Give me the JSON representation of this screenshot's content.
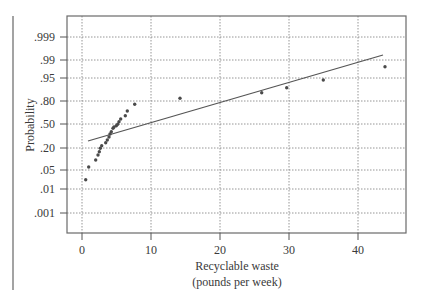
{
  "chart_data": {
    "type": "scatter",
    "subtype": "normal-probability-plot",
    "title": "",
    "xlabel": "Recyclable waste",
    "xlabel_line2": "(pounds per week)",
    "ylabel": "Probability",
    "xlim": [
      -1.9,
      45.1
    ],
    "x_ticks": [
      0,
      10,
      20,
      30,
      40
    ],
    "x_tick_labels": [
      "0",
      "10",
      "20",
      "30",
      "40"
    ],
    "y_ticks": [
      0.999,
      0.99,
      0.95,
      0.8,
      0.5,
      0.2,
      0.05,
      0.01,
      0.001
    ],
    "y_tick_labels": [
      ".999",
      ".99",
      ".95",
      ".80",
      ".50",
      ".20",
      ".05",
      ".01",
      ".001"
    ],
    "grid": true,
    "legend": null,
    "series": [
      {
        "name": "Observed data",
        "kind": "points",
        "x": [
          0.5,
          1.0,
          2.0,
          2.3,
          2.5,
          2.7,
          2.9,
          3.4,
          3.7,
          3.9,
          4.1,
          4.2,
          4.5,
          4.6,
          5.0,
          5.2,
          5.4,
          5.6,
          6.3,
          6.6,
          7.6,
          14.2,
          26.0,
          29.7,
          35.0,
          43.9
        ],
        "y": [
          0.025,
          0.07,
          0.12,
          0.15,
          0.18,
          0.2,
          0.24,
          0.28,
          0.31,
          0.35,
          0.38,
          0.41,
          0.45,
          0.46,
          0.48,
          0.5,
          0.54,
          0.57,
          0.62,
          0.68,
          0.77,
          0.83,
          0.87,
          0.89,
          0.94,
          0.97
        ]
      },
      {
        "name": "Normal reference line",
        "kind": "line",
        "x": [
          0.9,
          43.6
        ],
        "y": [
          0.31,
          0.975
        ]
      }
    ]
  },
  "layout_px": {
    "frame": {
      "left": 67,
      "top": 16,
      "right": 406,
      "bottom": 233
    },
    "x_px": {
      "0": 82,
      "10": 151,
      "20": 220,
      "30": 289,
      "40": 358
    },
    "y_px": {
      ".999": 37,
      ".99": 60,
      ".95": 78,
      ".80": 101,
      ".50": 124,
      ".20": 148,
      ".05": 170,
      ".01": 189,
      ".001": 213
    },
    "points_px": [
      [
        85.7,
        179.7
      ],
      [
        88.7,
        167
      ],
      [
        95.7,
        160
      ],
      [
        98,
        155
      ],
      [
        99.3,
        151.7
      ],
      [
        100.3,
        148.3
      ],
      [
        101.7,
        145.7
      ],
      [
        105.7,
        142.7
      ],
      [
        107.3,
        140
      ],
      [
        109,
        137
      ],
      [
        110,
        134
      ],
      [
        111.3,
        131.7
      ],
      [
        113,
        128.3
      ],
      [
        114,
        127
      ],
      [
        116.3,
        125.7
      ],
      [
        117.7,
        124.3
      ],
      [
        119,
        121.7
      ],
      [
        120.7,
        119
      ],
      [
        125.3,
        115.7
      ],
      [
        127.3,
        111
      ],
      [
        134.7,
        104.3
      ],
      [
        180,
        98.3
      ],
      [
        261.7,
        92.7
      ],
      [
        286.7,
        87.7
      ],
      [
        323.3,
        80
      ],
      [
        385,
        66.7
      ]
    ],
    "line_px": [
      [
        88,
        141
      ],
      [
        383,
        55
      ]
    ]
  }
}
